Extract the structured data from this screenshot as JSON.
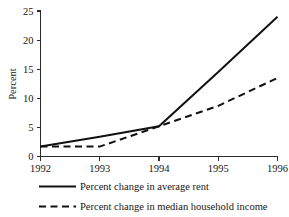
{
  "chart_data": {
    "type": "line",
    "title": "",
    "xlabel": "",
    "ylabel": "Percent",
    "x": [
      1992,
      1993,
      1994,
      1995,
      1996
    ],
    "xtick_labels": [
      "1992",
      "1993",
      "1994",
      "1995",
      "1996"
    ],
    "ytick_labels": [
      "0",
      "5",
      "10",
      "15",
      "20",
      "25"
    ],
    "yticks": [
      0,
      5,
      10,
      15,
      20,
      25
    ],
    "xlim": [
      1992,
      1996
    ],
    "ylim": [
      0,
      25
    ],
    "grid": false,
    "legend_position": "below",
    "series": [
      {
        "name": "Percent change in average rent",
        "style": "solid",
        "color": "#111111",
        "values": [
          1.7,
          3.4,
          5.2,
          14.5,
          24.0
        ]
      },
      {
        "name": "Percent change in median household income",
        "style": "dashed",
        "color": "#111111",
        "values": [
          1.7,
          1.7,
          5.2,
          8.7,
          13.5
        ]
      }
    ]
  },
  "legend": {
    "items": [
      {
        "label": "Percent change in average rent",
        "style": "solid"
      },
      {
        "label": "Percent change in median household income",
        "style": "dashed"
      }
    ]
  }
}
